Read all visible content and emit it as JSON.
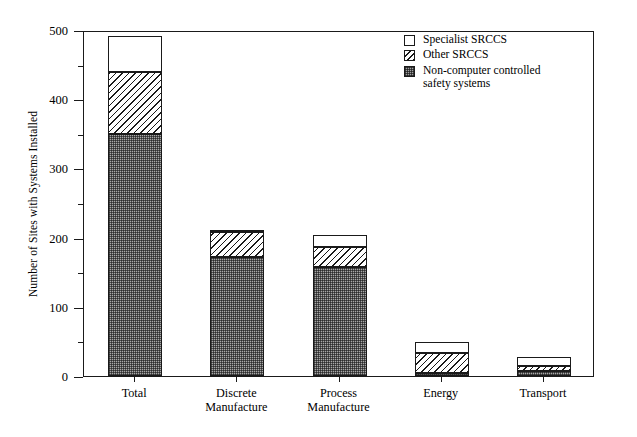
{
  "chart_data": {
    "type": "bar",
    "subtype": "stacked-bar",
    "title": "",
    "xlabel": "",
    "ylabel": "Number of Sites with Systems Installed",
    "ylim": [
      0,
      500
    ],
    "ytick_labels": [
      "0",
      "100",
      "200",
      "300",
      "400",
      "500"
    ],
    "ytick_values": [
      0,
      100,
      200,
      300,
      400,
      500
    ],
    "yminor_step": 50,
    "grid": false,
    "legend_position": "top-right",
    "categories": [
      "Total",
      "Discrete\nManufacture",
      "Process\nManufacture",
      "Energy",
      "Transport"
    ],
    "category_labels_flat": [
      "Total",
      "Discrete Manufacture",
      "Process Manufacture",
      "Energy",
      "Transport"
    ],
    "series": [
      {
        "name": "Non-computer controlled safety systems",
        "pattern": "checkered-gray",
        "values": [
          350,
          172,
          158,
          4,
          7
        ]
      },
      {
        "name": "Other SRCCS",
        "pattern": "diagonal-hatch",
        "values": [
          90,
          36,
          29,
          29,
          7
        ]
      },
      {
        "name": "Specialist SRCCS",
        "pattern": "white",
        "values": [
          51,
          2,
          17,
          16,
          14
        ]
      }
    ],
    "stack_totals": [
      491,
      210,
      204,
      49,
      28
    ]
  },
  "legend": {
    "entries": [
      {
        "label": "Specialist SRCCS",
        "swatch": "white-square-icon"
      },
      {
        "label": "Other SRCCS",
        "swatch": "hatched-square-icon"
      },
      {
        "label": "Non-computer controlled\nsafety systems",
        "swatch": "checkered-square-icon"
      }
    ]
  },
  "axes": {
    "y_title": "Number of Sites with Systems Installed",
    "y_ticks": [
      "500",
      "400",
      "300",
      "200",
      "100",
      "0"
    ],
    "x_ticks": [
      "Total",
      "Discrete\nManufacture",
      "Process\nManufacture",
      "Energy",
      "Transport"
    ]
  }
}
